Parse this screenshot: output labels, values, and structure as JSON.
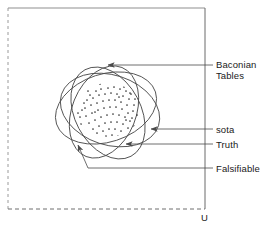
{
  "diagram": {
    "title_present": false,
    "universe": {
      "label": "U",
      "border_top": "solid",
      "border_right": "solid",
      "border_left": "dashed",
      "border_bottom": "dashed",
      "stroke_color": "#808080"
    },
    "stroke_color": "#4a4a4a",
    "dot_color": "#333333",
    "leader_color": "#555555",
    "labels": [
      {
        "id": "baconian-tables",
        "text_line1": "Baconian",
        "text_line2": "Tables"
      },
      {
        "id": "sota",
        "text": "sota"
      },
      {
        "id": "truth",
        "text": "Truth"
      },
      {
        "id": "falsifiable",
        "text": "Falsifiable"
      }
    ],
    "sets": [
      {
        "name": "Baconian Tables",
        "shape": "oval",
        "rotation_deg": -20
      },
      {
        "name": "sota",
        "shape": "oval",
        "rotation_deg": 62
      },
      {
        "name": "Truth",
        "shape": "oval",
        "rotation_deg": 20
      },
      {
        "name": "Falsifiable",
        "shape": "oval",
        "rotation_deg": 115
      }
    ],
    "dot_cloud": {
      "description": "scattered point cloud in the central intersection region",
      "count": 84
    }
  }
}
